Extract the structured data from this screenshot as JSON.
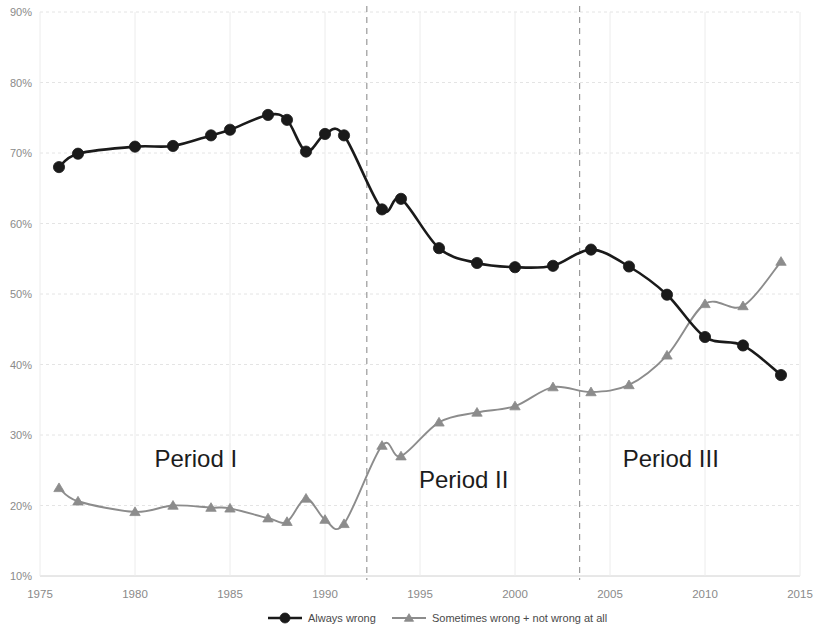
{
  "chart_data": {
    "type": "line",
    "title": "",
    "xlabel": "",
    "ylabel": "",
    "xlim": [
      1975,
      2015
    ],
    "ylim": [
      10,
      90
    ],
    "grid": true,
    "legend_position": "bottom",
    "y_ticks": [
      "10%",
      "20%",
      "30%",
      "40%",
      "50%",
      "60%",
      "70%",
      "80%",
      "90%"
    ],
    "y_tick_values": [
      10,
      20,
      30,
      40,
      50,
      60,
      70,
      80,
      90
    ],
    "x_ticks": [
      "1975",
      "1980",
      "1985",
      "1990",
      "1995",
      "2000",
      "2005",
      "2010",
      "2015"
    ],
    "x_tick_values": [
      1975,
      1980,
      1985,
      1990,
      1995,
      2000,
      2005,
      2010,
      2015
    ],
    "series": [
      {
        "name": "Always wrong",
        "color": "#1a1a1a",
        "marker": "circle",
        "x": [
          1976,
          1977,
          1980,
          1982,
          1984,
          1985,
          1987,
          1988,
          1989,
          1990,
          1991,
          1993,
          1994,
          1996,
          1998,
          2000,
          2002,
          2004,
          2006,
          2008,
          2010,
          2012,
          2014
        ],
        "values": [
          68.0,
          69.9,
          70.9,
          71.0,
          72.5,
          73.3,
          75.4,
          74.7,
          70.2,
          72.7,
          72.5,
          62.0,
          63.5,
          56.5,
          54.4,
          53.8,
          54.0,
          56.3,
          53.9,
          49.9,
          43.9,
          42.7,
          38.5
        ]
      },
      {
        "name": "Sometimes wrong + not wrong at all",
        "color": "#8c8c8c",
        "marker": "triangle",
        "x": [
          1976,
          1977,
          1980,
          1982,
          1984,
          1985,
          1987,
          1988,
          1989,
          1990,
          1991,
          1993,
          1994,
          1996,
          1998,
          2000,
          2002,
          2004,
          2006,
          2008,
          2010,
          2012,
          2014
        ],
        "values": [
          22.5,
          20.6,
          19.1,
          20.0,
          19.7,
          19.6,
          18.2,
          17.7,
          21.0,
          18.0,
          17.4,
          28.5,
          27.0,
          31.8,
          33.2,
          34.1,
          36.8,
          36.1,
          37.1,
          41.3,
          48.6,
          48.3,
          54.6
        ]
      }
    ],
    "annotations": [
      {
        "text": "Period I",
        "x": 1983.2,
        "y": 25.5
      },
      {
        "text": "Period II",
        "x": 1997.3,
        "y": 22.5
      },
      {
        "text": "Period III",
        "x": 2008.2,
        "y": 25.5
      }
    ],
    "dividers": [
      {
        "x": 1992.2
      },
      {
        "x": 2003.4
      }
    ]
  },
  "legend": {
    "items": [
      {
        "label": "Always wrong",
        "color": "#1a1a1a",
        "marker": "circle"
      },
      {
        "label": "Sometimes wrong + not wrong at all",
        "color": "#8c8c8c",
        "marker": "triangle"
      }
    ]
  }
}
